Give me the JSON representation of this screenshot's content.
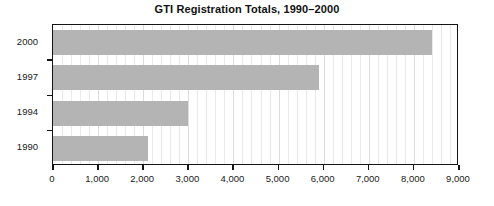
{
  "chart_data": {
    "type": "bar",
    "orientation": "horizontal",
    "title": "GTI Registration Totals, 1990–2000",
    "xlabel": "",
    "ylabel": "",
    "categories": [
      "1990",
      "1994",
      "1997",
      "2000"
    ],
    "values": [
      2100,
      3000,
      5900,
      8400
    ],
    "series": [
      {
        "name": "Registrations",
        "values": [
          2100,
          3000,
          5900,
          8400
        ],
        "color": "#b4b4b4"
      }
    ],
    "xlim": [
      0,
      9000
    ],
    "xticks": [
      0,
      1000,
      2000,
      3000,
      4000,
      5000,
      6000,
      7000,
      8000,
      9000
    ],
    "xtick_labels": [
      "0",
      "1,000",
      "2,000",
      "3,000",
      "4,000",
      "5,000",
      "6,000",
      "7,000",
      "8,000",
      "9,000"
    ],
    "ytick_labels_top_to_bottom": [
      "2000",
      "1997",
      "1994",
      "1990"
    ],
    "grid": true,
    "grid_axis": "x",
    "minor_grid_step": 200,
    "legend": false,
    "legend_position": "none",
    "bar_color": "#b4b4b4",
    "axis_color": "#141414",
    "background": "#ffffff"
  }
}
